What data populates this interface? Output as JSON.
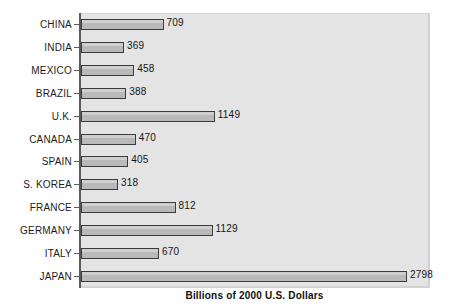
{
  "chart_data": {
    "type": "bar",
    "orientation": "horizontal",
    "title": "",
    "xlabel": "Billions of 2000 U.S. Dollars",
    "ylabel": "",
    "xlim": [
      0,
      2798
    ],
    "grid": false,
    "legend": null,
    "categories": [
      "CHINA",
      "INDIA",
      "MEXICO",
      "BRAZIL",
      "U.K.",
      "CANADA",
      "SPAIN",
      "S. KOREA",
      "FRANCE",
      "GERMANY",
      "ITALY",
      "JAPAN"
    ],
    "values": [
      709,
      369,
      458,
      388,
      1149,
      470,
      405,
      318,
      812,
      1129,
      670,
      2798
    ],
    "data_labels": [
      "709",
      "369",
      "458",
      "388",
      "1149",
      "470",
      "405",
      "318",
      "812",
      "1129",
      "670",
      "2798"
    ],
    "colors": {
      "bar_fill": "#b9b9b9",
      "bar_border": "#3b3b3b",
      "plot_background": "#e4e4e4",
      "axis_line": "#5a5a5a",
      "text": "#1b1b1b",
      "page_background": "#ffffff"
    }
  }
}
